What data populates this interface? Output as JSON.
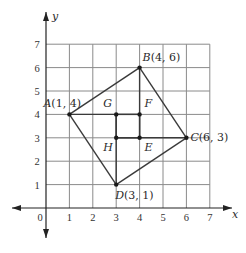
{
  "diagram": {
    "type": "coordinate-plane-figure",
    "axes": {
      "x_label": "x",
      "y_label": "y",
      "origin_label": "0",
      "x_ticks": [
        "1",
        "2",
        "3",
        "4",
        "5",
        "6",
        "7"
      ],
      "y_ticks": [
        "1",
        "2",
        "3",
        "4",
        "5",
        "6",
        "7"
      ],
      "grid": {
        "x_min": 0,
        "x_max": 7,
        "y_min": 0,
        "y_max": 7
      }
    },
    "points": [
      {
        "name": "A",
        "x": 1,
        "y": 4,
        "label": "A(1, 4)"
      },
      {
        "name": "B",
        "x": 4,
        "y": 6,
        "label": "B(4, 6)"
      },
      {
        "name": "C",
        "x": 6,
        "y": 3,
        "label": "C(6, 3)"
      },
      {
        "name": "D",
        "x": 3,
        "y": 1,
        "label": "D(3, 1)"
      },
      {
        "name": "G",
        "x": 3,
        "y": 4,
        "label": "G"
      },
      {
        "name": "F",
        "x": 4,
        "y": 4,
        "label": "F"
      },
      {
        "name": "H",
        "x": 3,
        "y": 3,
        "label": "H"
      },
      {
        "name": "E",
        "x": 4,
        "y": 3,
        "label": "E"
      }
    ],
    "segments": [
      [
        "A",
        "B"
      ],
      [
        "B",
        "C"
      ],
      [
        "C",
        "D"
      ],
      [
        "D",
        "A"
      ],
      [
        "A",
        "F"
      ],
      [
        "H",
        "C"
      ],
      [
        "B",
        "E"
      ],
      [
        "G",
        "D"
      ],
      [
        "G",
        "F"
      ],
      [
        "H",
        "E"
      ],
      [
        "G",
        "H"
      ],
      [
        "F",
        "E"
      ]
    ],
    "colors": {
      "line": "#3a3a3a",
      "grid": "#8a8a8a",
      "point": "#1a1a1a"
    }
  }
}
